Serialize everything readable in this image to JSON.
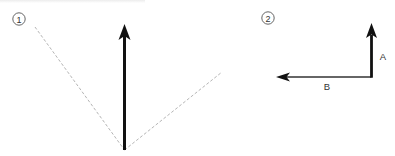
{
  "figures": [
    {
      "id": "1",
      "marker_label": "1",
      "elements": [
        "vertical-arrow",
        "dashed-v-lines"
      ]
    },
    {
      "id": "2",
      "marker_label": "2",
      "vectors": [
        {
          "name": "A",
          "label": "A",
          "direction": "up"
        },
        {
          "name": "B",
          "label": "B",
          "direction": "left"
        }
      ]
    }
  ],
  "colors": {
    "arrow": "#111111",
    "thin_arrow": "#333333",
    "dashed": "#b5b5b5",
    "marker": "#555555"
  }
}
